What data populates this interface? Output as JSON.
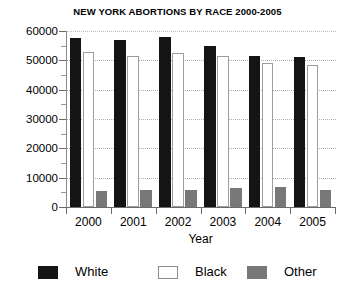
{
  "chart_data": {
    "type": "bar",
    "title": "NEW YORK ABORTIONS BY RACE 2000-2005",
    "xlabel": "Year",
    "ylabel": "",
    "categories": [
      "2000",
      "2001",
      "2002",
      "2003",
      "2004",
      "2005"
    ],
    "series": [
      {
        "name": "White",
        "color": "#141414",
        "values": [
          57500,
          57000,
          58000,
          55000,
          51500,
          51000
        ]
      },
      {
        "name": "Black",
        "color": "#ffffff",
        "values": [
          53000,
          51500,
          52500,
          51500,
          49000,
          48500
        ]
      },
      {
        "name": "Other",
        "color": "#787878",
        "values": [
          5500,
          5800,
          5800,
          6500,
          6700,
          5700
        ]
      }
    ],
    "ylim": [
      0,
      60000
    ],
    "ytick_labels": [
      "0",
      "10000",
      "20000",
      "30000",
      "40000",
      "50000",
      "60000"
    ],
    "ytick_values": [
      0,
      10000,
      20000,
      30000,
      40000,
      50000,
      60000
    ],
    "yminor_values": [
      5000,
      15000,
      25000,
      35000,
      45000,
      55000
    ],
    "grid": true,
    "legend_position": "bottom",
    "legend": [
      {
        "label": "White",
        "swatch": "sw-white"
      },
      {
        "label": "Black",
        "swatch": "sw-black"
      },
      {
        "label": "Other",
        "swatch": "sw-other"
      }
    ]
  }
}
